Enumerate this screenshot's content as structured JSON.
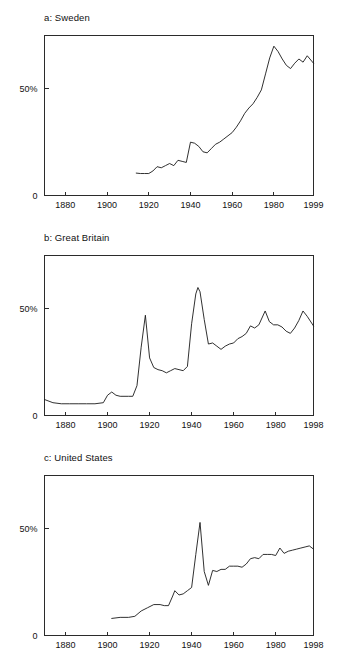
{
  "figure": {
    "background": "#ffffff",
    "line_color": "#1a1a1a",
    "axis_color": "#2b2b2b",
    "panel_count": 3
  },
  "panels": [
    {
      "key": "sweden",
      "title": "a: Sweden",
      "y_ticks": [
        {
          "label": "50%",
          "value": 50
        },
        {
          "label": "0",
          "value": 0
        }
      ],
      "x_ticks": [
        "1880",
        "1900",
        "1920",
        "1940",
        "1960",
        "1980",
        "1999"
      ]
    },
    {
      "key": "great-britain",
      "title": "b: Great Britain",
      "y_ticks": [
        {
          "label": "50%",
          "value": 50
        },
        {
          "label": "0",
          "value": 0
        }
      ],
      "x_ticks": [
        "1880",
        "1900",
        "1920",
        "1940",
        "1960",
        "1980",
        "1998"
      ]
    },
    {
      "key": "united-states",
      "title": "c: United States",
      "y_ticks": [
        {
          "label": "50%",
          "value": 50
        },
        {
          "label": "0",
          "value": 0
        }
      ],
      "x_ticks": [
        "1880",
        "1900",
        "1920",
        "1940",
        "1960",
        "1980",
        "1998"
      ]
    }
  ],
  "chart_data": [
    {
      "type": "line",
      "title": "a: Sweden",
      "xlabel": "",
      "ylabel": "",
      "xlim": [
        1870,
        1999
      ],
      "ylim": [
        0,
        75
      ],
      "grid": false,
      "legend": "none",
      "xtick_values": [
        1880,
        1900,
        1920,
        1940,
        1960,
        1980,
        1999
      ],
      "xtick_labels": [
        "1880",
        "1900",
        "1920",
        "1940",
        "1960",
        "1980",
        "1999"
      ],
      "ytick_values": [
        0,
        50
      ],
      "ytick_labels": [
        "0",
        "50%"
      ],
      "series": [
        {
          "name": "Sweden",
          "x": [
            1914,
            1916,
            1918,
            1920,
            1922,
            1924,
            1926,
            1928,
            1930,
            1932,
            1934,
            1936,
            1938,
            1940,
            1942,
            1944,
            1946,
            1948,
            1950,
            1952,
            1954,
            1956,
            1958,
            1960,
            1962,
            1964,
            1966,
            1968,
            1970,
            1972,
            1974,
            1976,
            1978,
            1980,
            1982,
            1984,
            1986,
            1988,
            1990,
            1992,
            1994,
            1996,
            1999
          ],
          "y": [
            10.5,
            10.3,
            10.3,
            10.3,
            11.5,
            13.5,
            13.0,
            14.0,
            15.0,
            14.0,
            16.5,
            16.0,
            15.5,
            25.0,
            24.5,
            23.0,
            20.5,
            20.0,
            22.0,
            24.0,
            25.0,
            26.5,
            28.0,
            29.5,
            32.0,
            35.0,
            38.5,
            41.0,
            43.0,
            46.0,
            49.5,
            57.0,
            64.5,
            70.0,
            67.5,
            64.0,
            61.0,
            59.5,
            62.0,
            64.0,
            62.5,
            65.5,
            62.0
          ]
        }
      ]
    },
    {
      "type": "line",
      "title": "b: Great Britain",
      "xlabel": "",
      "ylabel": "",
      "xlim": [
        1870,
        1998
      ],
      "ylim": [
        0,
        75
      ],
      "grid": false,
      "legend": "none",
      "xtick_values": [
        1880,
        1900,
        1920,
        1940,
        1960,
        1980,
        1998
      ],
      "xtick_labels": [
        "1880",
        "1900",
        "1920",
        "1940",
        "1960",
        "1980",
        "1998"
      ],
      "ytick_values": [
        0,
        50
      ],
      "ytick_labels": [
        "0",
        "50%"
      ],
      "series": [
        {
          "name": "Great Britain",
          "x": [
            1870,
            1874,
            1878,
            1882,
            1886,
            1890,
            1894,
            1898,
            1900,
            1902,
            1904,
            1906,
            1910,
            1912,
            1914,
            1916,
            1918,
            1920,
            1922,
            1924,
            1926,
            1928,
            1930,
            1932,
            1934,
            1936,
            1938,
            1940,
            1942,
            1943,
            1944,
            1946,
            1948,
            1950,
            1952,
            1954,
            1956,
            1958,
            1960,
            1962,
            1964,
            1966,
            1968,
            1970,
            1972,
            1975,
            1977,
            1979,
            1981,
            1983,
            1985,
            1987,
            1989,
            1991,
            1993,
            1995,
            1998
          ],
          "y": [
            7.5,
            6.0,
            5.5,
            5.5,
            5.5,
            5.5,
            5.5,
            6.0,
            9.5,
            11.0,
            9.5,
            9.0,
            9.0,
            9.0,
            14.0,
            32.0,
            47.0,
            27.0,
            22.5,
            21.5,
            21.0,
            20.0,
            21.0,
            22.0,
            21.5,
            21.0,
            23.0,
            43.0,
            57.0,
            60.0,
            58.0,
            45.0,
            33.5,
            34.0,
            32.5,
            31.0,
            32.5,
            33.5,
            34.0,
            36.0,
            37.0,
            38.5,
            42.0,
            41.0,
            42.5,
            49.0,
            44.0,
            42.5,
            42.5,
            41.5,
            39.5,
            38.5,
            41.0,
            44.5,
            49.0,
            46.5,
            42.0
          ]
        }
      ]
    },
    {
      "type": "line",
      "title": "c: United States",
      "xlabel": "",
      "ylabel": "",
      "xlim": [
        1870,
        1998
      ],
      "ylim": [
        0,
        75
      ],
      "grid": false,
      "legend": "none",
      "xtick_values": [
        1880,
        1900,
        1920,
        1940,
        1960,
        1980,
        1998
      ],
      "xtick_labels": [
        "1880",
        "1900",
        "1920",
        "1940",
        "1960",
        "1980",
        "1998"
      ],
      "ytick_values": [
        0,
        50
      ],
      "ytick_labels": [
        "0",
        "50%"
      ],
      "series": [
        {
          "name": "United States",
          "x": [
            1902,
            1906,
            1910,
            1913,
            1916,
            1919,
            1922,
            1925,
            1927,
            1929,
            1931,
            1932,
            1934,
            1936,
            1938,
            1940,
            1942,
            1944,
            1946,
            1948,
            1950,
            1952,
            1954,
            1956,
            1958,
            1960,
            1962,
            1964,
            1966,
            1968,
            1970,
            1972,
            1974,
            1976,
            1978,
            1980,
            1982,
            1984,
            1986,
            1988,
            1990,
            1992,
            1994,
            1996,
            1998
          ],
          "y": [
            8.0,
            8.5,
            8.5,
            9.0,
            11.5,
            13.0,
            14.5,
            14.5,
            14.0,
            14.0,
            18.5,
            21.0,
            19.0,
            19.5,
            21.0,
            22.5,
            38.0,
            53.0,
            30.0,
            23.5,
            30.5,
            30.0,
            31.0,
            31.0,
            32.5,
            32.5,
            32.5,
            32.0,
            33.5,
            36.0,
            36.5,
            36.0,
            38.0,
            38.0,
            38.0,
            37.5,
            41.0,
            38.5,
            39.5,
            40.0,
            40.5,
            41.0,
            41.5,
            42.0,
            40.5
          ]
        }
      ]
    }
  ]
}
